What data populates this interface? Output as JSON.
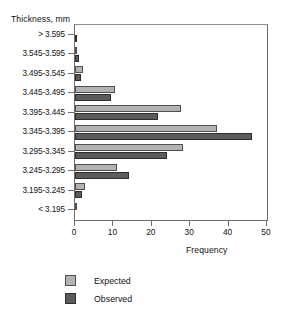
{
  "chart_data": {
    "type": "bar",
    "orientation": "horizontal",
    "title": "",
    "xlabel": "Frequency",
    "ylabel": "Thickness, mm",
    "xlim": [
      0,
      50
    ],
    "xticks": [
      0,
      10,
      20,
      30,
      40,
      50
    ],
    "grid": false,
    "legend_position": "bottom-left",
    "categories": [
      "> 3.595",
      "3.545-3.595",
      "3.495-3.545",
      "3.445-3.495",
      "3.395-3.445",
      "3.345-3.395",
      "3.295-3.345",
      "3.245-3.295",
      "3.195-3.245",
      "< 3.195"
    ],
    "series": [
      {
        "name": "Expected",
        "color": "#b2b2b2",
        "values": [
          0,
          0.3,
          2,
          10.5,
          27.5,
          37,
          28,
          11,
          2.5,
          0.2
        ]
      },
      {
        "name": "Observed",
        "color": "#5b5b5b",
        "values": [
          0.2,
          1,
          1.5,
          9.5,
          21.5,
          46,
          24,
          14,
          1.8,
          0
        ]
      }
    ]
  },
  "axes": {
    "y_title": "Thickness, mm",
    "x_title": "Frequency"
  },
  "legend": {
    "items": [
      {
        "label": "Expected",
        "color": "#b2b2b2"
      },
      {
        "label": "Observed",
        "color": "#5b5b5b"
      }
    ]
  },
  "title_remnant": ""
}
